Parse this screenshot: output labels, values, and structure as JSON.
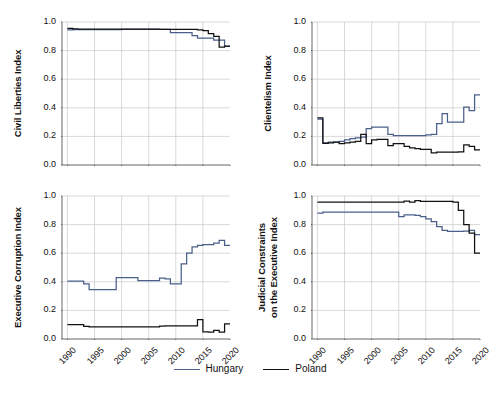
{
  "figure": {
    "width": 500,
    "height": 397,
    "background": "#ffffff"
  },
  "legend": {
    "position": "bottom-center",
    "entries": [
      {
        "label": "Hungary",
        "color": "#4a5f8a"
      },
      {
        "label": "Poland",
        "color": "#111111"
      }
    ]
  },
  "axes": {
    "ytick_labels": [
      "0.0",
      "0.2",
      "0.4",
      "0.6",
      "0.8",
      "1.0"
    ],
    "ytick_values": [
      0.0,
      0.2,
      0.4,
      0.6,
      0.8,
      1.0
    ],
    "xtick_labels": [
      "1990",
      "1995",
      "2000",
      "2005",
      "2010",
      "2015",
      "2020"
    ],
    "xtick_values": [
      1990,
      1995,
      2000,
      2005,
      2010,
      2015,
      2020
    ],
    "xlim": [
      1989,
      2020
    ],
    "ylim": [
      0.0,
      1.0
    ]
  },
  "chart_data": [
    {
      "id": "civil-liberties",
      "type": "line",
      "title": "",
      "xlabel": "",
      "ylabel": "Civil Liberties Index",
      "xlim": [
        1989,
        2020
      ],
      "ylim": [
        0.0,
        1.0
      ],
      "grid": true,
      "drawstyle": "steps-post",
      "xticks_labeled": false,
      "x": [
        1990,
        1991,
        1992,
        1993,
        1994,
        1995,
        1996,
        1997,
        1998,
        1999,
        2000,
        2001,
        2002,
        2003,
        2004,
        2005,
        2006,
        2007,
        2008,
        2009,
        2010,
        2011,
        2012,
        2013,
        2014,
        2015,
        2016,
        2017,
        2018,
        2019
      ],
      "series": [
        {
          "name": "Hungary",
          "color": "#4a5f8a",
          "values": [
            0.945,
            0.946,
            0.946,
            0.946,
            0.947,
            0.947,
            0.947,
            0.947,
            0.947,
            0.947,
            0.948,
            0.948,
            0.948,
            0.948,
            0.948,
            0.948,
            0.948,
            0.948,
            0.948,
            0.925,
            0.925,
            0.925,
            0.925,
            0.905,
            0.887,
            0.887,
            0.887,
            0.874,
            0.874,
            0.83
          ]
        },
        {
          "name": "Poland",
          "color": "#111111",
          "values": [
            0.955,
            0.952,
            0.95,
            0.95,
            0.95,
            0.95,
            0.95,
            0.95,
            0.95,
            0.95,
            0.95,
            0.95,
            0.95,
            0.95,
            0.95,
            0.95,
            0.95,
            0.948,
            0.948,
            0.948,
            0.948,
            0.948,
            0.948,
            0.948,
            0.945,
            0.94,
            0.918,
            0.9,
            0.825,
            0.832
          ]
        }
      ]
    },
    {
      "id": "clientelism",
      "type": "line",
      "title": "",
      "xlabel": "",
      "ylabel": "Clientelism Index",
      "xlim": [
        1989,
        2020
      ],
      "ylim": [
        0.0,
        1.0
      ],
      "grid": true,
      "drawstyle": "steps-post",
      "xticks_labeled": false,
      "x": [
        1990,
        1991,
        1992,
        1993,
        1994,
        1995,
        1996,
        1997,
        1998,
        1999,
        2000,
        2001,
        2002,
        2003,
        2004,
        2005,
        2006,
        2007,
        2008,
        2009,
        2010,
        2011,
        2012,
        2013,
        2014,
        2015,
        2016,
        2017,
        2018,
        2019
      ],
      "series": [
        {
          "name": "Hungary",
          "color": "#4a5f8a",
          "values": [
            0.32,
            0.155,
            0.16,
            0.16,
            0.165,
            0.175,
            0.185,
            0.19,
            0.195,
            0.255,
            0.265,
            0.265,
            0.265,
            0.215,
            0.205,
            0.205,
            0.205,
            0.205,
            0.205,
            0.205,
            0.21,
            0.215,
            0.29,
            0.36,
            0.3,
            0.3,
            0.3,
            0.405,
            0.38,
            0.49
          ]
        },
        {
          "name": "Poland",
          "color": "#111111",
          "values": [
            0.33,
            0.152,
            0.155,
            0.16,
            0.15,
            0.155,
            0.16,
            0.165,
            0.215,
            0.15,
            0.175,
            0.18,
            0.18,
            0.135,
            0.15,
            0.15,
            0.13,
            0.12,
            0.115,
            0.11,
            0.11,
            0.085,
            0.09,
            0.09,
            0.09,
            0.09,
            0.092,
            0.14,
            0.13,
            0.105
          ]
        }
      ]
    },
    {
      "id": "executive-corruption",
      "type": "line",
      "title": "",
      "xlabel": "",
      "ylabel": "Executive Corruption Index",
      "xlim": [
        1989,
        2020
      ],
      "ylim": [
        0.0,
        1.0
      ],
      "grid": true,
      "drawstyle": "steps-post",
      "xticks_labeled": true,
      "x": [
        1990,
        1991,
        1992,
        1993,
        1994,
        1995,
        1996,
        1997,
        1998,
        1999,
        2000,
        2001,
        2002,
        2003,
        2004,
        2005,
        2006,
        2007,
        2008,
        2009,
        2010,
        2011,
        2012,
        2013,
        2014,
        2015,
        2016,
        2017,
        2018,
        2019
      ],
      "series": [
        {
          "name": "Hungary",
          "color": "#4a5f8a",
          "values": [
            0.405,
            0.405,
            0.405,
            0.385,
            0.345,
            0.345,
            0.345,
            0.345,
            0.345,
            0.43,
            0.43,
            0.43,
            0.43,
            0.408,
            0.408,
            0.408,
            0.408,
            0.425,
            0.42,
            0.385,
            0.385,
            0.525,
            0.6,
            0.645,
            0.655,
            0.66,
            0.66,
            0.67,
            0.69,
            0.655
          ]
        },
        {
          "name": "Poland",
          "color": "#111111",
          "values": [
            0.1,
            0.1,
            0.1,
            0.088,
            0.085,
            0.085,
            0.085,
            0.085,
            0.085,
            0.085,
            0.085,
            0.085,
            0.085,
            0.085,
            0.085,
            0.085,
            0.085,
            0.09,
            0.092,
            0.092,
            0.092,
            0.092,
            0.092,
            0.092,
            0.135,
            0.05,
            0.048,
            0.06,
            0.048,
            0.105
          ]
        }
      ]
    },
    {
      "id": "judicial-constraints",
      "type": "line",
      "title": "",
      "xlabel": "",
      "ylabel": "Judicial Constraints on the Executive Index",
      "ylabel_line1": "Judicial Constraints",
      "ylabel_line2": "on the Executive Index",
      "xlim": [
        1989,
        2020
      ],
      "ylim": [
        0.0,
        1.0
      ],
      "grid": true,
      "drawstyle": "steps-post",
      "xticks_labeled": true,
      "x": [
        1990,
        1991,
        1992,
        1993,
        1994,
        1995,
        1996,
        1997,
        1998,
        1999,
        2000,
        2001,
        2002,
        2003,
        2004,
        2005,
        2006,
        2007,
        2008,
        2009,
        2010,
        2011,
        2012,
        2013,
        2014,
        2015,
        2016,
        2017,
        2018,
        2019
      ],
      "series": [
        {
          "name": "Hungary",
          "color": "#4a5f8a",
          "values": [
            0.88,
            0.888,
            0.888,
            0.888,
            0.888,
            0.888,
            0.888,
            0.888,
            0.888,
            0.888,
            0.888,
            0.888,
            0.888,
            0.888,
            0.888,
            0.855,
            0.868,
            0.868,
            0.865,
            0.855,
            0.84,
            0.82,
            0.785,
            0.76,
            0.752,
            0.752,
            0.752,
            0.755,
            0.76,
            0.73
          ]
        },
        {
          "name": "Poland",
          "color": "#111111",
          "values": [
            0.958,
            0.958,
            0.958,
            0.958,
            0.958,
            0.958,
            0.958,
            0.958,
            0.958,
            0.958,
            0.958,
            0.958,
            0.958,
            0.958,
            0.958,
            0.958,
            0.965,
            0.958,
            0.968,
            0.962,
            0.962,
            0.962,
            0.962,
            0.962,
            0.962,
            0.958,
            0.9,
            0.8,
            0.74,
            0.6
          ]
        }
      ]
    }
  ]
}
